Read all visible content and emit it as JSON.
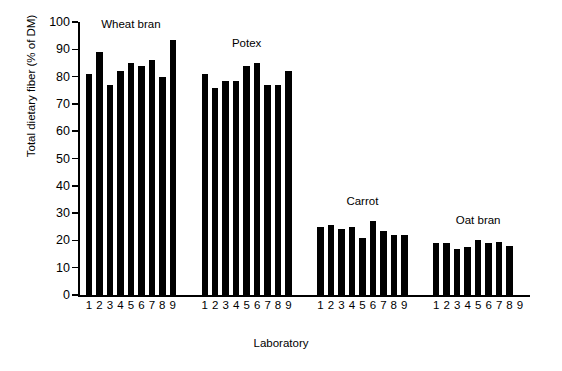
{
  "chart_data": {
    "type": "bar",
    "title": "",
    "xlabel": "Laboratory",
    "ylabel": "Total dietary fiber (% of DM)",
    "ylim": [
      0,
      100
    ],
    "ytick_step": 10,
    "yticks": [
      0,
      10,
      20,
      30,
      40,
      50,
      60,
      70,
      80,
      90,
      100
    ],
    "grid": false,
    "legend": "none",
    "categories": [
      "1",
      "2",
      "3",
      "4",
      "5",
      "6",
      "7",
      "8",
      "9"
    ],
    "groups": [
      {
        "name": "Wheat bran",
        "labels": [
          "1",
          "2",
          "3",
          "4",
          "5",
          "6",
          "7",
          "8",
          "9"
        ],
        "values": [
          81.0,
          89.0,
          77.0,
          82.0,
          85.0,
          84.0,
          86.0,
          80.0,
          93.5
        ]
      },
      {
        "name": "Potex",
        "labels": [
          "1",
          "2",
          "3",
          "4",
          "5",
          "6",
          "7",
          "8",
          "9"
        ],
        "values": [
          81.0,
          76.0,
          78.5,
          78.5,
          84.0,
          85.0,
          77.0,
          77.0,
          82.0
        ]
      },
      {
        "name": "Carrot",
        "labels": [
          "1",
          "2",
          "3",
          "4",
          "5",
          "6",
          "7",
          "8",
          "9"
        ],
        "values": [
          25.0,
          25.5,
          24.0,
          25.0,
          21.0,
          27.0,
          23.5,
          22.0,
          22.0
        ]
      },
      {
        "name": "Oat bran",
        "labels": [
          "1",
          "2",
          "3",
          "4",
          "5",
          "6",
          "7",
          "8",
          "9"
        ],
        "values": [
          19.0,
          19.0,
          17.0,
          17.5,
          20.0,
          19.0,
          19.5,
          18.0,
          null
        ]
      }
    ],
    "colors": {
      "bar": "#000000",
      "axis": "#000000",
      "background": "#ffffff"
    }
  }
}
